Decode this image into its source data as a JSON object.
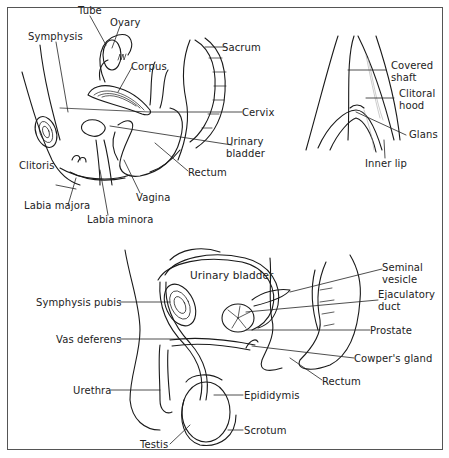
{
  "figure": {
    "panels": [
      {
        "id": "female-sagittal",
        "title": "",
        "labels": [
          "Tube",
          "Ovary",
          "Symphysis",
          "Corpus",
          "Sacrum",
          "Cervix",
          "Urinary bladder",
          "Rectum",
          "Clitoris",
          "Vagina",
          "Labia majora",
          "Labia minora"
        ]
      },
      {
        "id": "female-external",
        "title": "",
        "labels": [
          "Covered shaft",
          "Clitoral hood",
          "Glans",
          "Inner lip"
        ]
      },
      {
        "id": "male-sagittal",
        "title": "",
        "labels": [
          "Urinary bladder",
          "Seminal vesicle",
          "Ejaculatory duct",
          "Symphysis pubis",
          "Prostate",
          "Vas deferens",
          "Cowper's gland",
          "Rectum",
          "Urethra",
          "Epididymis",
          "Scrotum",
          "Testis"
        ]
      }
    ]
  },
  "labels": {
    "tube": "Tube",
    "ovary": "Ovary",
    "symphysis": "Symphysis",
    "corpus": "Corpus",
    "sacrum": "Sacrum",
    "cervix": "Cervix",
    "f_bladder_1": "Urinary",
    "f_bladder_2": "bladder",
    "f_rectum": "Rectum",
    "clitoris": "Clitoris",
    "vagina": "Vagina",
    "labia_majora": "Labia majora",
    "labia_minora": "Labia minora",
    "covered_shaft_1": "Covered",
    "covered_shaft_2": "shaft",
    "clitoral_hood_1": "Clitoral",
    "clitoral_hood_2": "hood",
    "glans": "Glans",
    "inner_lip": "Inner lip",
    "m_bladder": "Urinary bladder",
    "seminal_vesicle_1": "Seminal",
    "seminal_vesicle_2": "vesicle",
    "ejaculatory_duct_1": "Ejaculatory",
    "ejaculatory_duct_2": "duct",
    "symphysis_pubis": "Symphysis pubis",
    "prostate": "Prostate",
    "vas_deferens": "Vas deferens",
    "cowpers_gland": "Cowper's gland",
    "m_rectum": "Rectum",
    "urethra": "Urethra",
    "epididymis": "Epididymis",
    "scrotum": "Scrotum",
    "testis": "Testis"
  },
  "colors": {
    "ink": "#1a1a1a",
    "background": "#ffffff",
    "border": "#555555"
  }
}
